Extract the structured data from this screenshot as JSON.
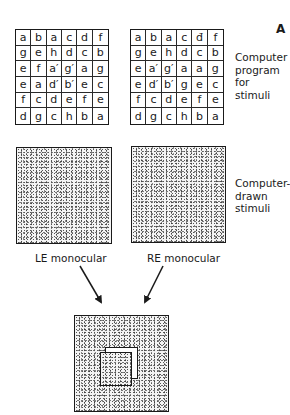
{
  "panel_label": "A",
  "grids": {
    "left": {
      "rows": [
        [
          "a",
          "b",
          "a",
          "c",
          "d",
          "f"
        ],
        [
          "g",
          "e",
          "h",
          "d",
          "c",
          "b"
        ],
        [
          "e",
          "f",
          "a′",
          "g′",
          "a",
          "g"
        ],
        [
          "e",
          "a",
          "d′",
          "b′",
          "e",
          "c"
        ],
        [
          "f",
          "c",
          "d",
          "e",
          "f",
          "e"
        ],
        [
          "d",
          "g",
          "c",
          "h",
          "b",
          "a"
        ]
      ]
    },
    "right": {
      "rows": [
        [
          "a",
          "b",
          "a",
          "c",
          "đ",
          "f"
        ],
        [
          "g",
          "e",
          "h",
          "d",
          "c",
          "b"
        ],
        [
          "e",
          "a′",
          "g′",
          "a",
          "a",
          "g"
        ],
        [
          "e",
          "d′",
          "b′",
          "g",
          "e",
          "c"
        ],
        [
          "f",
          "c",
          "d",
          "e",
          "f",
          "e"
        ],
        [
          "d",
          "g",
          "c",
          "h",
          "b",
          "a"
        ]
      ]
    }
  },
  "labels": {
    "program": [
      "Computer",
      "program",
      "for",
      "stimuli"
    ],
    "drawn": [
      "Computer-",
      "drawn",
      "stimuli"
    ],
    "left_eye": "LE monocular",
    "right_eye": "RE monocular"
  },
  "stimuli": {
    "left": "random-dot stereogram, left eye",
    "right": "random-dot stereogram, right eye",
    "fused": "fused percept with central square in depth"
  }
}
